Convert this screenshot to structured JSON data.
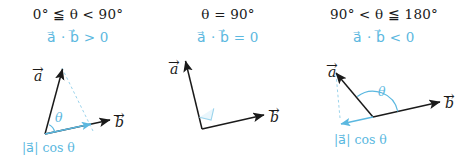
{
  "figure": {
    "background": "#ffffff",
    "accent_color": "#5BB8E0",
    "ink_color": "#1a1a1a"
  },
  "panels": [
    {
      "id": "acute",
      "condition": "0° ≦ θ < 90°",
      "dot_product": "a⃗ · b⃗ > 0",
      "vector_a_label": "a",
      "vector_b_label": "b",
      "angle_label": "θ",
      "projection_label": "|a⃗| cos θ",
      "has_projection": true,
      "has_right_angle_marker": false
    },
    {
      "id": "right",
      "condition": "θ = 90°",
      "dot_product": "a⃗ · b⃗ = 0",
      "vector_a_label": "a",
      "vector_b_label": "b",
      "angle_label": "",
      "projection_label": "",
      "has_projection": false,
      "has_right_angle_marker": true
    },
    {
      "id": "obtuse",
      "condition": "90° < θ ≦ 180°",
      "dot_product": "a⃗ · b⃗ < 0",
      "vector_a_label": "a",
      "vector_b_label": "b",
      "angle_label": "θ",
      "projection_label": "|a⃗| cos θ",
      "has_projection": true,
      "has_right_angle_marker": false
    }
  ]
}
